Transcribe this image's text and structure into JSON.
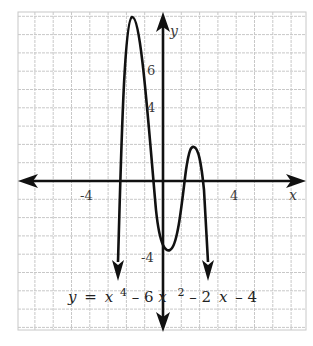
{
  "chart_data": {
    "type": "line",
    "title": "",
    "equation": "y = x^4 - 6x^2 - 2x - 4",
    "equation_label": {
      "y": "y",
      "eq": "=",
      "x1": "x",
      "p1": "4",
      "minus1": "– 6",
      "x2": "x",
      "p2": "2",
      "minus2": "– 2",
      "x3": "x",
      "minus3": "– 4"
    },
    "xlabel": "x",
    "ylabel": "y",
    "xlim": [
      -8,
      7.8
    ],
    "ylim": [
      -8.1,
      9.3
    ],
    "grid": true,
    "grid_step": 1,
    "x_ticks": [
      {
        "value": -4,
        "label": "-4"
      },
      {
        "value": 4,
        "label": "4"
      }
    ],
    "y_ticks": [
      {
        "value": 6,
        "label": "6"
      },
      {
        "value": 4,
        "label": "4"
      },
      {
        "value": -4,
        "label": "-4"
      }
    ],
    "series": [
      {
        "name": "y = x^4 - 6x^2 - 2x - 4",
        "color": "#111111",
        "key_points": [
          {
            "x": -2.5,
            "y": -6.3,
            "note": "left arrow end (down)"
          },
          {
            "x": -1.7,
            "y": 8.9,
            "note": "local max"
          },
          {
            "x": -0.3,
            "y": 0,
            "note": "x-intercept"
          },
          {
            "x": 0.3,
            "y": -3.8,
            "note": "local min"
          },
          {
            "x": 1.1,
            "y": 0,
            "note": "x-intercept"
          },
          {
            "x": 1.7,
            "y": 1.9,
            "note": "local max"
          },
          {
            "x": 2.2,
            "y": 0,
            "note": "x-intercept"
          },
          {
            "x": 2.5,
            "y": -6.3,
            "note": "right arrow end (down)"
          }
        ]
      }
    ],
    "colors": {
      "grid": "#c8c8c8",
      "axis": "#111111",
      "curve": "#111111",
      "background": "#ffffff"
    }
  }
}
